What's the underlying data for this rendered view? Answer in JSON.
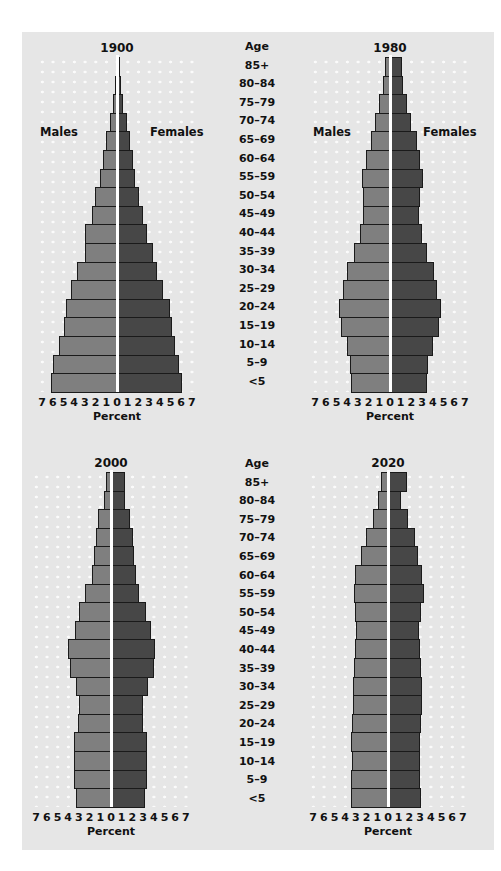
{
  "chart_data": [
    {
      "type": "bar",
      "subtype": "population-pyramid",
      "title": "1900",
      "xlabel": "Percent",
      "ylabel": "Age",
      "xlim": [
        -7,
        7
      ],
      "x_ticks": [
        7,
        6,
        5,
        4,
        3,
        2,
        1,
        0,
        1,
        2,
        3,
        4,
        5,
        6,
        7
      ],
      "grid": "dotted",
      "legend": [
        "Males",
        "Females"
      ],
      "categories": [
        "85+",
        "80–84",
        "75–79",
        "70–74",
        "65–69",
        "60–64",
        "55–59",
        "50–54",
        "45–49",
        "40–44",
        "35–39",
        "30–34",
        "25–29",
        "20–24",
        "15–19",
        "10–14",
        "5–9",
        "<5"
      ],
      "series": [
        {
          "name": "Males",
          "values": [
            0.1,
            0.2,
            0.4,
            0.7,
            1.0,
            1.3,
            1.6,
            2.1,
            2.3,
            3.0,
            3.0,
            3.7,
            4.3,
            4.8,
            5.0,
            5.4,
            6.0,
            6.2
          ]
        },
        {
          "name": "Females",
          "values": [
            0.2,
            0.3,
            0.5,
            0.8,
            1.1,
            1.4,
            1.6,
            2.0,
            2.3,
            2.7,
            3.3,
            3.6,
            4.2,
            4.9,
            5.0,
            5.3,
            5.7,
            6.0
          ]
        }
      ]
    },
    {
      "type": "bar",
      "subtype": "population-pyramid",
      "title": "1980",
      "xlabel": "Percent",
      "ylabel": "Age",
      "xlim": [
        -7,
        7
      ],
      "x_ticks": [
        7,
        6,
        5,
        4,
        3,
        2,
        1,
        0,
        1,
        2,
        3,
        4,
        5,
        6,
        7
      ],
      "grid": "dotted",
      "legend": [
        "Males",
        "Females"
      ],
      "categories": [
        "85+",
        "80–84",
        "75–79",
        "70–74",
        "65–69",
        "60–64",
        "55–59",
        "50–54",
        "45–49",
        "40–44",
        "35–39",
        "30–34",
        "25–29",
        "20–24",
        "15–19",
        "10–14",
        "5–9",
        "<5"
      ],
      "series": [
        {
          "name": "Males",
          "values": [
            0.5,
            0.7,
            1.0,
            1.4,
            1.8,
            2.2,
            2.6,
            2.5,
            2.5,
            2.8,
            3.4,
            4.0,
            4.4,
            4.8,
            4.6,
            4.0,
            3.7,
            3.6
          ]
        },
        {
          "name": "Females",
          "values": [
            1.0,
            1.1,
            1.5,
            1.9,
            2.4,
            2.7,
            3.0,
            2.7,
            2.6,
            2.9,
            3.4,
            4.0,
            4.3,
            4.7,
            4.5,
            3.9,
            3.5,
            3.4
          ]
        }
      ]
    },
    {
      "type": "bar",
      "subtype": "population-pyramid",
      "title": "2000",
      "xlabel": "Percent",
      "ylabel": "Age",
      "xlim": [
        -7,
        7
      ],
      "x_ticks": [
        7,
        6,
        5,
        4,
        3,
        2,
        1,
        0,
        1,
        2,
        3,
        4,
        5,
        6,
        7
      ],
      "grid": "dotted",
      "categories": [
        "85+",
        "80–84",
        "75–79",
        "70–74",
        "65–69",
        "60–64",
        "55–59",
        "50–54",
        "45–49",
        "40–44",
        "35–39",
        "30–34",
        "25–29",
        "20–24",
        "15–19",
        "10–14",
        "5–9",
        "<5"
      ],
      "series": [
        {
          "name": "Males",
          "values": [
            0.5,
            0.7,
            1.2,
            1.4,
            1.6,
            1.8,
            2.4,
            3.0,
            3.4,
            4.0,
            3.8,
            3.3,
            3.0,
            3.1,
            3.5,
            3.5,
            3.5,
            3.3
          ]
        },
        {
          "name": "Females",
          "values": [
            1.2,
            1.2,
            1.7,
            2.0,
            2.1,
            2.2,
            2.5,
            3.2,
            3.6,
            4.0,
            3.9,
            3.4,
            2.9,
            2.9,
            3.3,
            3.3,
            3.3,
            3.1
          ]
        }
      ]
    },
    {
      "type": "bar",
      "subtype": "population-pyramid",
      "title": "2020",
      "xlabel": "Percent",
      "ylabel": "Age",
      "xlim": [
        -7,
        7
      ],
      "x_ticks": [
        7,
        6,
        5,
        4,
        3,
        2,
        1,
        0,
        1,
        2,
        3,
        4,
        5,
        6,
        7
      ],
      "grid": "dotted",
      "categories": [
        "85+",
        "80–84",
        "75–79",
        "70–74",
        "65–69",
        "60–64",
        "55–59",
        "50–54",
        "45–49",
        "40–44",
        "35–39",
        "30–34",
        "25–29",
        "20–24",
        "15–19",
        "10–14",
        "5–9",
        "<5"
      ],
      "series": [
        {
          "name": "Males",
          "values": [
            0.7,
            0.9,
            1.4,
            2.1,
            2.5,
            3.1,
            3.2,
            3.1,
            3.0,
            3.1,
            3.2,
            3.3,
            3.3,
            3.4,
            3.5,
            3.4,
            3.5,
            3.5
          ]
        },
        {
          "name": "Females",
          "values": [
            1.7,
            1.1,
            1.8,
            2.4,
            2.7,
            3.1,
            3.3,
            3.0,
            2.8,
            2.9,
            3.0,
            3.1,
            3.1,
            3.0,
            2.9,
            2.9,
            2.9,
            3.0
          ]
        }
      ]
    }
  ],
  "labels": {
    "age_header": "Age",
    "males": "Males",
    "females": "Females",
    "percent": "Percent",
    "ages": [
      "85+",
      "80–84",
      "75–79",
      "70–74",
      "65–69",
      "60–64",
      "55–59",
      "50–54",
      "45–49",
      "40–44",
      "35–39",
      "30–34",
      "25–29",
      "20–24",
      "15–19",
      "10–14",
      "5–9",
      "<5"
    ],
    "ticks": [
      "7",
      "6",
      "5",
      "4",
      "3",
      "2",
      "1",
      "0",
      "1",
      "2",
      "3",
      "4",
      "5",
      "6",
      "7"
    ]
  },
  "colors": {
    "panel_bg": "#e6e6e6",
    "males_bar": "#7f7f7f",
    "females_bar": "#474747",
    "center_line": "#ffffff"
  }
}
